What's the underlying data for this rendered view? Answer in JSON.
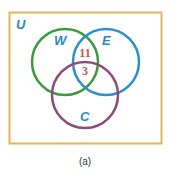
{
  "diagram": {
    "type": "venn",
    "caption": "(a)",
    "universe": {
      "label": "U",
      "border_color": "#e3b45a",
      "label_color": "#2b88c8"
    },
    "sets": [
      {
        "label": "W",
        "circle_color": "#3a9a3a",
        "label_color": "#2b88c8"
      },
      {
        "label": "E",
        "circle_color": "#2b8fd0",
        "label_color": "#2b88c8"
      },
      {
        "label": "C",
        "circle_color": "#8e4a78",
        "label_color": "#2b88c8"
      }
    ],
    "regions": [
      {
        "sets": "W∩E only",
        "value": "11",
        "color": "#d0534a"
      },
      {
        "sets": "W∩E∩C",
        "value": "3",
        "color": "#d0534a"
      }
    ]
  }
}
